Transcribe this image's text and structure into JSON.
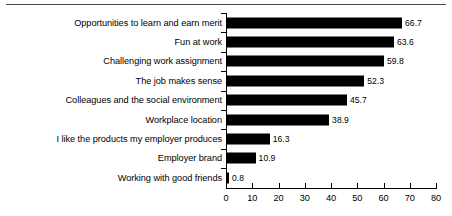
{
  "chart_data": {
    "type": "bar",
    "orientation": "horizontal",
    "title": "",
    "subtitle": "",
    "xlabel": "",
    "ylabel": "",
    "xlim": [
      0,
      80
    ],
    "xticks": [
      0,
      10,
      20,
      30,
      40,
      50,
      60,
      70,
      80
    ],
    "grid": false,
    "legend": false,
    "bar_color": "#000000",
    "categories": [
      "Opportunities to learn and earn merit",
      "Fun at work",
      "Challenging work assignment",
      "The job makes sense",
      "Colleagues and the social environment",
      "Workplace location",
      "I like the products my employer produces",
      "Employer brand",
      "Working with good friends"
    ],
    "values": [
      66.7,
      63.6,
      59.8,
      52.3,
      45.7,
      38.9,
      16.3,
      10.9,
      0.8
    ],
    "value_labels": [
      "66.7",
      "63.6",
      "59.8",
      "52.3",
      "45.7",
      "38.9",
      "16.3",
      "10.9",
      "0.8"
    ],
    "xtick_labels": [
      "0",
      "10",
      "20",
      "30",
      "40",
      "50",
      "60",
      "70",
      "80"
    ]
  }
}
